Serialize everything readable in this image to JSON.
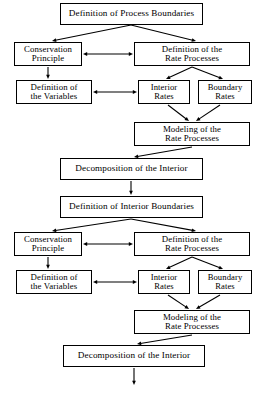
{
  "diagram": {
    "type": "flowchart",
    "style": {
      "background": "#ffffff",
      "box_border": "#000000",
      "text_color": "#000000",
      "arrow_color": "#000000"
    },
    "nodes": [
      {
        "id": "n1",
        "label": "Definition of Process Boundaries",
        "x": 60,
        "y": 3,
        "w": 143,
        "h": 22,
        "size": "wide"
      },
      {
        "id": "n2",
        "label": "Conservation\nPrinciple",
        "x": 14,
        "y": 42,
        "w": 68,
        "h": 24,
        "size": "med"
      },
      {
        "id": "n3",
        "label": "Definition of the\nRate Processes",
        "x": 134,
        "y": 42,
        "w": 116,
        "h": 24,
        "size": "med"
      },
      {
        "id": "n4",
        "label": "Definition of\nthe Variables",
        "x": 16,
        "y": 80,
        "w": 76,
        "h": 24,
        "size": "med"
      },
      {
        "id": "n5",
        "label": "Interior\nRates",
        "x": 138,
        "y": 80,
        "w": 52,
        "h": 24,
        "size": "small"
      },
      {
        "id": "n6",
        "label": "Boundary\nRates",
        "x": 198,
        "y": 80,
        "w": 54,
        "h": 24,
        "size": "small"
      },
      {
        "id": "n7",
        "label": "Modeling of the\nRate Processes",
        "x": 134,
        "y": 122,
        "w": 116,
        "h": 24,
        "size": "med"
      },
      {
        "id": "n8",
        "label": "Decomposition of the Interior",
        "x": 60,
        "y": 158,
        "w": 143,
        "h": 22,
        "size": "wide"
      },
      {
        "id": "n9",
        "label": "Definition of Interior Boundaries",
        "x": 60,
        "y": 196,
        "w": 143,
        "h": 22,
        "size": "wide"
      },
      {
        "id": "n10",
        "label": "Conservation\nPrinciple",
        "x": 14,
        "y": 232,
        "w": 68,
        "h": 24,
        "size": "med"
      },
      {
        "id": "n11",
        "label": "Definition of the\nRate Processes",
        "x": 134,
        "y": 232,
        "w": 116,
        "h": 24,
        "size": "med"
      },
      {
        "id": "n12",
        "label": "Definition of\nthe Variables",
        "x": 16,
        "y": 270,
        "w": 76,
        "h": 24,
        "size": "med"
      },
      {
        "id": "n13",
        "label": "Interior\nRates",
        "x": 138,
        "y": 270,
        "w": 52,
        "h": 24,
        "size": "small"
      },
      {
        "id": "n14",
        "label": "Boundary\nRates",
        "x": 198,
        "y": 270,
        "w": 54,
        "h": 24,
        "size": "small"
      },
      {
        "id": "n15",
        "label": "Modeling of the\nRate Processes",
        "x": 134,
        "y": 310,
        "w": 116,
        "h": 24,
        "size": "med"
      },
      {
        "id": "n16",
        "label": "Decomposition of the Interior",
        "x": 63,
        "y": 345,
        "w": 142,
        "h": 22,
        "size": "wide"
      }
    ],
    "edges": [
      {
        "from": "n1",
        "to": "n2",
        "kind": "single",
        "x1": 131,
        "y1": 25,
        "x2": 52,
        "y2": 41
      },
      {
        "from": "n1",
        "to": "n3",
        "kind": "single",
        "x1": 131,
        "y1": 25,
        "x2": 196,
        "y2": 41
      },
      {
        "from": "n2",
        "to": "n3",
        "kind": "double",
        "x1": 83,
        "y1": 54,
        "x2": 133,
        "y2": 54
      },
      {
        "from": "n2",
        "to": "n4",
        "kind": "single",
        "x1": 48,
        "y1": 67,
        "x2": 48,
        "y2": 79
      },
      {
        "from": "n3",
        "to": "n5",
        "kind": "single",
        "x1": 192,
        "y1": 67,
        "x2": 166,
        "y2": 79
      },
      {
        "from": "n3",
        "to": "n6",
        "kind": "single",
        "x1": 192,
        "y1": 67,
        "x2": 223,
        "y2": 79
      },
      {
        "from": "n4",
        "to": "n5",
        "kind": "double",
        "x1": 93,
        "y1": 92,
        "x2": 137,
        "y2": 92
      },
      {
        "from": "n5",
        "to": "n7",
        "kind": "single",
        "x1": 168,
        "y1": 105,
        "x2": 189,
        "y2": 121
      },
      {
        "from": "n6",
        "to": "n7",
        "kind": "single",
        "x1": 220,
        "y1": 105,
        "x2": 196,
        "y2": 121
      },
      {
        "from": "n7",
        "to": "n8",
        "kind": "single",
        "x1": 192,
        "y1": 147,
        "x2": 134,
        "y2": 157
      },
      {
        "from": "n8",
        "to": "n9",
        "kind": "single",
        "x1": 131,
        "y1": 181,
        "x2": 131,
        "y2": 195
      },
      {
        "from": "n9",
        "to": "n10",
        "kind": "single",
        "x1": 131,
        "y1": 219,
        "x2": 52,
        "y2": 231
      },
      {
        "from": "n9",
        "to": "n11",
        "kind": "single",
        "x1": 131,
        "y1": 219,
        "x2": 196,
        "y2": 231
      },
      {
        "from": "n10",
        "to": "n11",
        "kind": "double",
        "x1": 83,
        "y1": 244,
        "x2": 133,
        "y2": 244
      },
      {
        "from": "n10",
        "to": "n12",
        "kind": "single",
        "x1": 48,
        "y1": 257,
        "x2": 48,
        "y2": 269
      },
      {
        "from": "n11",
        "to": "n13",
        "kind": "single",
        "x1": 192,
        "y1": 257,
        "x2": 166,
        "y2": 269
      },
      {
        "from": "n11",
        "to": "n14",
        "kind": "single",
        "x1": 192,
        "y1": 257,
        "x2": 223,
        "y2": 269
      },
      {
        "from": "n12",
        "to": "n13",
        "kind": "double",
        "x1": 93,
        "y1": 282,
        "x2": 137,
        "y2": 282
      },
      {
        "from": "n13",
        "to": "n15",
        "kind": "single",
        "x1": 168,
        "y1": 295,
        "x2": 189,
        "y2": 309
      },
      {
        "from": "n14",
        "to": "n15",
        "kind": "single",
        "x1": 220,
        "y1": 295,
        "x2": 196,
        "y2": 309
      },
      {
        "from": "n15",
        "to": "n16",
        "kind": "single",
        "x1": 192,
        "y1": 335,
        "x2": 137,
        "y2": 344
      },
      {
        "from": "n16",
        "to": "end",
        "kind": "single",
        "x1": 134,
        "y1": 368,
        "x2": 134,
        "y2": 385
      }
    ]
  }
}
